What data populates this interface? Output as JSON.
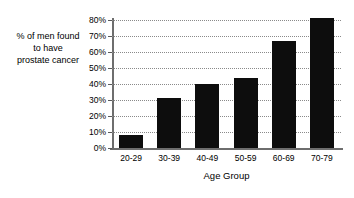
{
  "chart_data": {
    "type": "bar",
    "title": "",
    "subtitle": "",
    "categories": [
      "20-29",
      "30-39",
      "40-49",
      "50-59",
      "60-69",
      "70-79"
    ],
    "values": [
      8,
      31,
      40,
      44,
      67,
      81
    ],
    "xlabel": "Age Group",
    "ylabel": "% of men found to have prostate cancer",
    "ylabel_lines": [
      "% of men found",
      "to have",
      "prostate cancer"
    ],
    "ylim": [
      0,
      80
    ],
    "ytick_values": [
      0,
      10,
      20,
      30,
      40,
      50,
      60,
      70,
      80
    ],
    "ytick_labels": [
      "0%",
      "10%",
      "20%",
      "30%",
      "40%",
      "50%",
      "60%",
      "70%",
      "80%"
    ],
    "grid": true,
    "grid_style": "dotted",
    "legend": false,
    "legend_position": "none",
    "bar_color": "#0d0d0d",
    "axis_color": "#6e6e6e",
    "grid_color": "#8a8a8a",
    "background_color": "#ffffff"
  }
}
